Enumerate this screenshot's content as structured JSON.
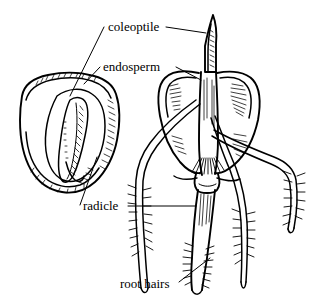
{
  "figure": {
    "style": "black and white line drawing",
    "background_color": "#ffffff",
    "ink_color": "#000000",
    "width": 318,
    "height": 302
  },
  "labels": [
    {
      "id": "coleoptile",
      "text": "coleoptile",
      "x": 108,
      "y": 31,
      "anchor": "start",
      "leaders": [
        {
          "from": [
            104,
            27
          ],
          "to": [
            70,
            96
          ]
        },
        {
          "from": [
            166,
            27
          ],
          "to": [
            206,
            33
          ]
        }
      ]
    },
    {
      "id": "endosperm",
      "text": "endosperm",
      "x": 103,
      "y": 71,
      "anchor": "start",
      "leaders": [
        {
          "from": [
            100,
            67
          ],
          "to": [
            84,
            84
          ]
        },
        {
          "from": [
            176,
            67
          ],
          "to": [
            201,
            80
          ]
        }
      ]
    },
    {
      "id": "radicle",
      "text": "radicle",
      "x": 83,
      "y": 210,
      "anchor": "start",
      "leaders": [
        {
          "from": [
            80,
            205
          ],
          "to": [
            97,
            157
          ]
        },
        {
          "from": [
            128,
            206
          ],
          "to": [
            196,
            206
          ]
        }
      ]
    },
    {
      "id": "root-hairs",
      "text": "root hairs",
      "x": 120,
      "y": 288,
      "anchor": "start",
      "leaders": [
        {
          "from": [
            179,
            282
          ],
          "to": [
            210,
            258
          ]
        }
      ]
    }
  ],
  "parts": {
    "seed": {
      "name": "ungerminated grain seed, cut away",
      "caption_parts": [
        "endosperm",
        "radicle"
      ]
    },
    "seedling": {
      "name": "germinated seedling with coleoptile and roots",
      "caption_parts": [
        "coleoptile",
        "endosperm",
        "radicle",
        "root hairs"
      ],
      "root_count": 4
    }
  }
}
